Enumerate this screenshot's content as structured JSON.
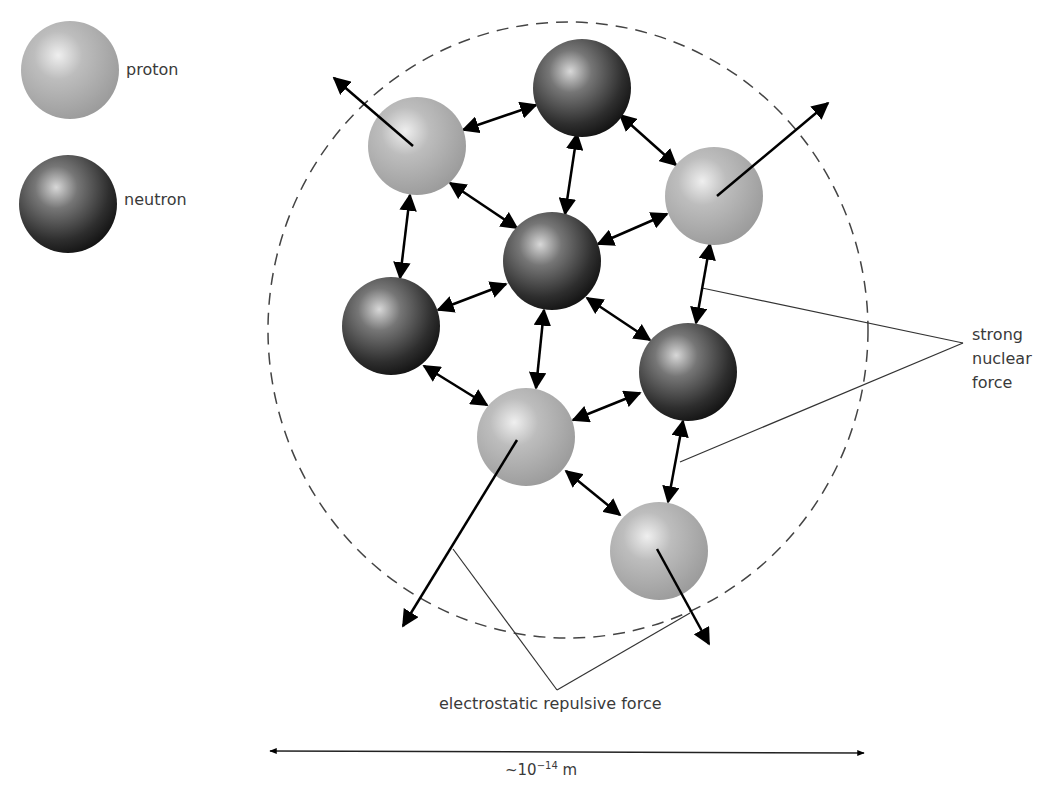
{
  "legend": {
    "proton": {
      "label": "proton",
      "color": "#b0b0b0"
    },
    "neutron": {
      "label": "neutron",
      "color": "#3a3a3a"
    }
  },
  "labels": {
    "strong_force_line1": "strong",
    "strong_force_line2": "nuclear",
    "strong_force_line3": "force",
    "electrostatic": "electrostatic repulsive force",
    "scale_prefix": "~10",
    "scale_exponent": "−14",
    "scale_unit": " m"
  },
  "nucleus": {
    "particles": [
      {
        "type": "proton",
        "x": 417,
        "y": 146
      },
      {
        "type": "neutron",
        "x": 582,
        "y": 88
      },
      {
        "type": "proton",
        "x": 714,
        "y": 196
      },
      {
        "type": "neutron",
        "x": 552,
        "y": 261
      },
      {
        "type": "neutron",
        "x": 391,
        "y": 326
      },
      {
        "type": "neutron",
        "x": 688,
        "y": 372
      },
      {
        "type": "proton",
        "x": 526,
        "y": 437
      },
      {
        "type": "proton",
        "x": 659,
        "y": 551
      }
    ]
  }
}
